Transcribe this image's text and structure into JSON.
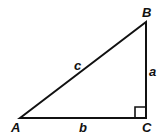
{
  "diagram": {
    "type": "right-triangle",
    "vertices": {
      "A": {
        "label": "A"
      },
      "B": {
        "label": "B"
      },
      "C": {
        "label": "C"
      }
    },
    "sides": {
      "a": {
        "label": "a",
        "between": "B-C"
      },
      "b": {
        "label": "b",
        "between": "A-C"
      },
      "c": {
        "label": "c",
        "between": "A-B"
      }
    },
    "right_angle_at": "C",
    "colors": {
      "stroke": "#111111",
      "background": "#ffffff"
    }
  }
}
